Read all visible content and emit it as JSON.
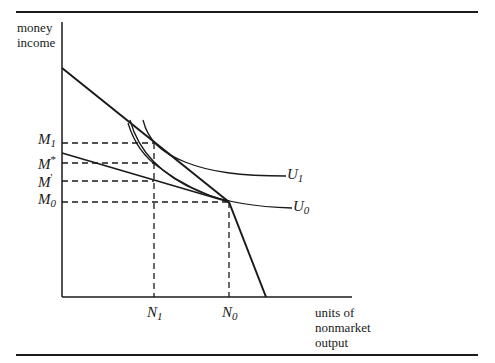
{
  "axes": {
    "y_label_line1": "money",
    "y_label_line2": "income",
    "x_label_line1": "units of",
    "x_label_line2": "nonmarket",
    "x_label_line3": "output"
  },
  "y_ticks": {
    "M1": {
      "base": "M",
      "sub": "1"
    },
    "Mstar": {
      "base": "M",
      "sup": "*"
    },
    "Mprime": {
      "base": "M",
      "sup": "'"
    },
    "M0": {
      "base": "M",
      "sub": "0"
    }
  },
  "x_ticks": {
    "N1": {
      "base": "N",
      "sub": "1"
    },
    "N0": {
      "base": "N",
      "sub": "0"
    }
  },
  "curves": {
    "U1": {
      "base": "U",
      "sub": "1"
    },
    "U0": {
      "base": "U",
      "sub": "0"
    }
  },
  "colors": {
    "ink": "#1a1a1a",
    "background": "#ffffff"
  }
}
